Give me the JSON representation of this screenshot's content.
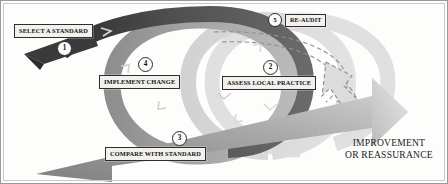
{
  "figure": {
    "background_color": "#fdfdfc",
    "border_color": "#8f8f8f"
  },
  "stages": [
    {
      "number": "1",
      "label": "SELECT A STANDARD",
      "band": "dark"
    },
    {
      "number": "2",
      "label": "ASSESS LOCAL PRACTICE",
      "band": "dark"
    },
    {
      "number": "3",
      "label": "COMPARE WITH STANDARD",
      "band": "mid"
    },
    {
      "number": "4",
      "label": "IMPLEMENT CHANGE",
      "band": "mid"
    },
    {
      "number": "5",
      "label": "RE-AUDIT",
      "band": "dashed"
    }
  ],
  "outcome": {
    "line1": "IMPROVEMENT",
    "line2": "OR REASSURANCE"
  },
  "colors": {
    "band_dark": "#4b4b4b",
    "band_mid": "#9a9a9a",
    "band_light": "#c9c9c9",
    "band_pale": "#dcdcdc",
    "arrow_dark": "#8d8d8d",
    "arrow_light": "#cfcfcf",
    "dashed_stroke": "#8a8a8a",
    "label_fill": "#f2f1ee",
    "label_border": "#2d2d2d",
    "text": "#121212"
  },
  "icons": {
    "chevron": "chevron-arrowhead-icon",
    "big_arrow": "upward-arrow-icon",
    "dashed_arrow": "dashed-spiral-arrow-icon"
  }
}
